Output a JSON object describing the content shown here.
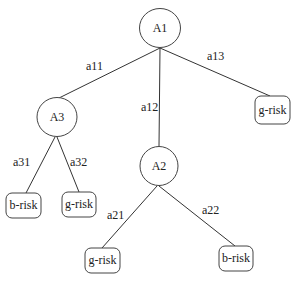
{
  "diagram": {
    "type": "decision-tree",
    "nodes": [
      {
        "id": "A1",
        "label": "A1",
        "shape": "circle",
        "cx": 160,
        "cy": 28
      },
      {
        "id": "A3",
        "label": "A3",
        "shape": "circle",
        "cx": 57,
        "cy": 117
      },
      {
        "id": "A2",
        "label": "A2",
        "shape": "circle",
        "cx": 159,
        "cy": 166
      },
      {
        "id": "leaf_a13",
        "label": "g-risk",
        "shape": "rounded-rect",
        "x": 255,
        "y": 96
      },
      {
        "id": "leaf_a31",
        "label": "b-risk",
        "shape": "rounded-rect",
        "x": 6,
        "y": 193
      },
      {
        "id": "leaf_a32",
        "label": "g-risk",
        "shape": "rounded-rect",
        "x": 62,
        "y": 192
      },
      {
        "id": "leaf_a21",
        "label": "g-risk",
        "shape": "rounded-rect",
        "x": 85,
        "y": 248
      },
      {
        "id": "leaf_a22",
        "label": "b-risk",
        "shape": "rounded-rect",
        "x": 219,
        "y": 246
      }
    ],
    "edges": [
      {
        "from": "A1",
        "to": "A3",
        "label": "a11"
      },
      {
        "from": "A1",
        "to": "A2",
        "label": "a12"
      },
      {
        "from": "A1",
        "to": "leaf_a13",
        "label": "a13"
      },
      {
        "from": "A3",
        "to": "leaf_a31",
        "label": "a31"
      },
      {
        "from": "A3",
        "to": "leaf_a32",
        "label": "a32"
      },
      {
        "from": "A2",
        "to": "leaf_a21",
        "label": "a21"
      },
      {
        "from": "A2",
        "to": "leaf_a22",
        "label": "a22"
      }
    ]
  }
}
